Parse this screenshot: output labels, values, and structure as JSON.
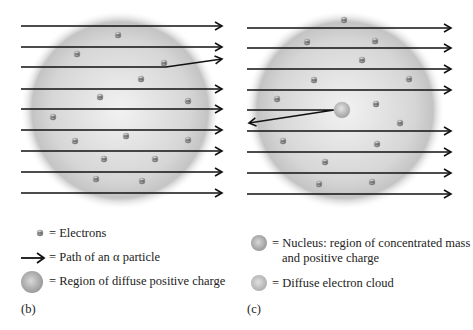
{
  "panel_b": {
    "label": "(b)",
    "legend": {
      "electrons": "= Electrons",
      "path": "= Path of an α particle",
      "region": "= Region of diffuse positive charge"
    }
  },
  "panel_c": {
    "label": "(c)",
    "legend": {
      "nucleus_line1": "= Nucleus: region of concentrated mass",
      "nucleus_line2": "and positive charge",
      "cloud": "= Diffuse electron cloud"
    }
  },
  "colors": {
    "arrow": "#111111",
    "cloud": "#bdbdbd",
    "electron": "#8a8a8a"
  }
}
